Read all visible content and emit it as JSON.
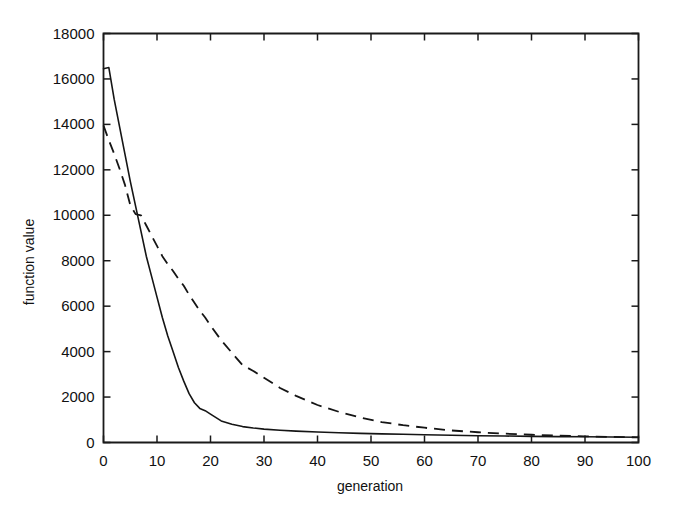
{
  "chart_data": {
    "type": "line",
    "title": "",
    "xlabel": "generation",
    "ylabel": "function value",
    "xlim": [
      0,
      100
    ],
    "ylim": [
      0,
      18000
    ],
    "grid": false,
    "legend": "none",
    "xticks": [
      "0",
      "10",
      "20",
      "30",
      "40",
      "50",
      "60",
      "70",
      "80",
      "90",
      "100"
    ],
    "xtick_values": [
      0,
      10,
      20,
      30,
      40,
      50,
      60,
      70,
      80,
      90,
      100
    ],
    "yticks": [
      "0",
      "2000",
      "4000",
      "6000",
      "8000",
      "10000",
      "12000",
      "14000",
      "16000",
      "18000"
    ],
    "ytick_values": [
      0,
      2000,
      4000,
      6000,
      8000,
      10000,
      12000,
      14000,
      16000,
      18000
    ],
    "x": [
      0,
      1,
      2,
      3,
      4,
      5,
      6,
      7,
      8,
      9,
      10,
      11,
      12,
      13,
      14,
      15,
      16,
      17,
      18,
      19,
      20,
      22,
      24,
      26,
      28,
      30,
      33,
      36,
      40,
      44,
      48,
      52,
      56,
      60,
      65,
      70,
      75,
      80,
      85,
      90,
      95,
      100
    ],
    "series": [
      {
        "name": "solid-curve",
        "style": "solid",
        "color": "#151515",
        "values": [
          16450,
          16500,
          15100,
          13900,
          12700,
          11500,
          10400,
          9300,
          8200,
          7300,
          6400,
          5500,
          4700,
          4000,
          3300,
          2700,
          2150,
          1750,
          1500,
          1400,
          1250,
          950,
          800,
          700,
          640,
          590,
          540,
          500,
          460,
          430,
          400,
          380,
          360,
          340,
          320,
          300,
          285,
          270,
          260,
          250,
          240,
          230
        ]
      },
      {
        "name": "dashed-curve",
        "style": "dashed",
        "color": "#151515",
        "values": [
          13950,
          13300,
          12700,
          12050,
          11350,
          10450,
          10050,
          10000,
          9550,
          9100,
          8650,
          8200,
          7850,
          7550,
          7200,
          6900,
          6500,
          6150,
          5800,
          5500,
          5150,
          4500,
          3950,
          3400,
          3150,
          2850,
          2400,
          2050,
          1650,
          1350,
          1100,
          900,
          760,
          650,
          530,
          450,
          390,
          340,
          300,
          270,
          245,
          225
        ]
      }
    ]
  }
}
